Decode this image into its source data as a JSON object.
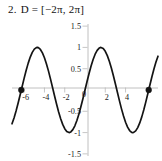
{
  "header": {
    "number": "2.",
    "domain_statement": "D = [−2π, 2π]",
    "variable": "D",
    "equals": "=",
    "interval": "[−2π, 2π]"
  },
  "colors": {
    "curve": "#141414",
    "axis": "#b9b9b9",
    "text": "#111111",
    "background": "#ffffff",
    "endpoint": "#141414"
  },
  "chart_data": {
    "type": "line",
    "title": "",
    "subtitle": "",
    "xlabel": "",
    "ylabel": "",
    "function": "y = sin(x)",
    "domain_text": "[−2π, 2π]",
    "xlim": [
      -7.2,
      7.2
    ],
    "ylim": [
      -1.55,
      1.55
    ],
    "grid": false,
    "legend": "none",
    "x_ticks": [
      -6,
      -4,
      -2,
      0,
      2,
      4
    ],
    "x_tick_labels": [
      "-6",
      "-4",
      "-2",
      "0",
      "2",
      "4"
    ],
    "y_ticks": [
      1.5,
      1,
      0.5,
      -0.5,
      -1,
      -1.5
    ],
    "y_tick_labels": [
      "1.5",
      "1",
      "0.5",
      "-0.5",
      "-1",
      "-1.5"
    ],
    "y_origin_label": "0",
    "endpoints": [
      {
        "x": -6.283,
        "y": 0,
        "marker": "filled-circle"
      },
      {
        "x": 6.283,
        "y": 0,
        "marker": "filled-circle"
      }
    ],
    "extrema": [
      {
        "x": -4.712,
        "y": 1,
        "kind": "maximum"
      },
      {
        "x": -1.571,
        "y": -1,
        "kind": "minimum"
      },
      {
        "x": 1.571,
        "y": 1,
        "kind": "maximum"
      },
      {
        "x": 4.712,
        "y": -1,
        "kind": "minimum"
      }
    ],
    "zeros": [
      -6.283,
      -3.142,
      0,
      3.142,
      6.283
    ],
    "series": [
      {
        "name": "sin(x)",
        "x": [
          -7.2,
          -7.0,
          -6.8,
          -6.6,
          -6.4,
          -6.283,
          -6.0,
          -5.8,
          -5.6,
          -5.4,
          -5.2,
          -5.0,
          -4.8,
          -4.712,
          -4.6,
          -4.4,
          -4.2,
          -4.0,
          -3.8,
          -3.6,
          -3.4,
          -3.142,
          -3.0,
          -2.8,
          -2.6,
          -2.4,
          -2.2,
          -2.0,
          -1.8,
          -1.571,
          -1.4,
          -1.2,
          -1.0,
          -0.8,
          -0.6,
          -0.4,
          -0.2,
          0.0,
          0.2,
          0.4,
          0.6,
          0.8,
          1.0,
          1.2,
          1.4,
          1.571,
          1.8,
          2.0,
          2.2,
          2.4,
          2.6,
          2.8,
          3.0,
          3.142,
          3.4,
          3.6,
          3.8,
          4.0,
          4.2,
          4.4,
          4.6,
          4.712,
          4.8,
          5.0,
          5.2,
          5.4,
          5.6,
          5.8,
          6.0,
          6.283,
          6.4,
          6.6,
          6.8,
          7.0,
          7.2
        ],
        "y": [
          -0.793,
          -0.657,
          -0.492,
          -0.312,
          -0.116,
          0.0,
          0.279,
          0.465,
          0.631,
          0.773,
          0.883,
          0.959,
          0.996,
          1.0,
          0.994,
          0.952,
          0.872,
          0.757,
          0.612,
          0.443,
          0.256,
          0.0,
          -0.141,
          -0.335,
          -0.516,
          -0.675,
          -0.808,
          -0.909,
          -0.974,
          -1.0,
          -0.985,
          -0.932,
          -0.841,
          -0.717,
          -0.565,
          -0.389,
          -0.199,
          0.0,
          0.199,
          0.389,
          0.565,
          0.717,
          0.841,
          0.932,
          0.985,
          1.0,
          0.974,
          0.909,
          0.808,
          0.675,
          0.516,
          0.335,
          0.141,
          0.0,
          -0.256,
          -0.443,
          -0.612,
          -0.757,
          -0.872,
          -0.952,
          -0.994,
          -1.0,
          -0.996,
          -0.959,
          -0.883,
          -0.773,
          -0.631,
          -0.465,
          -0.279,
          0.0,
          0.116,
          0.312,
          0.492,
          0.657,
          0.793
        ]
      }
    ]
  }
}
